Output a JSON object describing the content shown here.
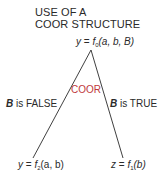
{
  "title": {
    "line1": "USE OF A",
    "line2": "COOR STRUCTURE"
  },
  "root_node": {
    "lhs": "y",
    "eq": " = ",
    "func": "f",
    "sub": "0",
    "args": "(a, b, B)"
  },
  "operator": {
    "label": "COOR",
    "color": "#c0393b"
  },
  "branches": {
    "left": {
      "var": "B",
      "text": " is FALSE"
    },
    "right": {
      "var": "B",
      "text": " is TRUE"
    }
  },
  "left_node": {
    "lhs": "y",
    "eq": " = ",
    "func": "f",
    "sub": "2",
    "args": "(a, b)"
  },
  "right_node": {
    "lhs": "z",
    "eq": " = ",
    "func": "f",
    "sub": "1",
    "args": "(b)"
  }
}
